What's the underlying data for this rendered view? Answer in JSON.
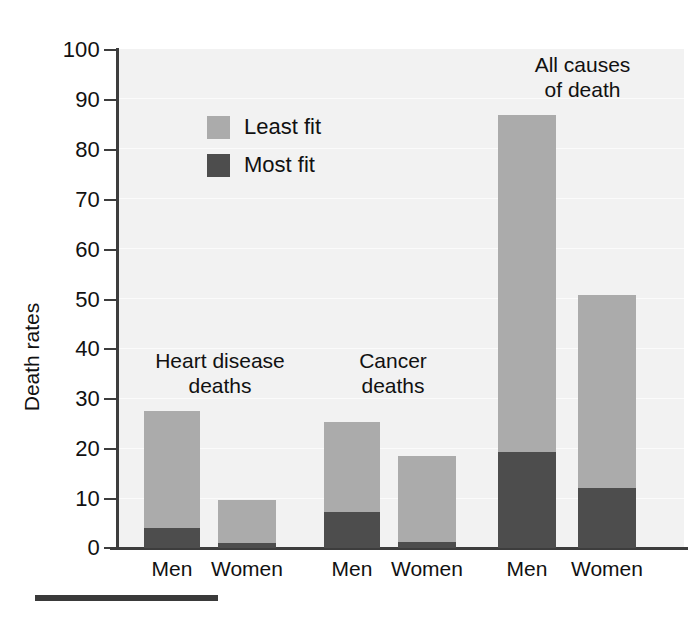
{
  "chart_data": {
    "type": "bar",
    "subtype": "stacked",
    "title": "",
    "xlabel": "",
    "ylabel": "Death rates",
    "ylim": [
      0,
      100
    ],
    "ytick_values": [
      0,
      10,
      20,
      30,
      40,
      50,
      60,
      70,
      80,
      90,
      100
    ],
    "ytick_labels": [
      "0",
      "10",
      "20",
      "30",
      "40",
      "50",
      "60",
      "70",
      "80",
      "90",
      "100"
    ],
    "grid": true,
    "legend_position": "upper-left-inside",
    "categories": [
      "Men",
      "Women",
      "Men",
      "Women",
      "Men",
      "Women"
    ],
    "groups": [
      {
        "label": "Heart disease\ndeaths",
        "label_line1": "Heart disease",
        "label_line2": "deaths",
        "bars": [
          {
            "category": "Men",
            "most_fit": 4.0,
            "least_fit": 23.5,
            "total": 27.5
          },
          {
            "category": "Women",
            "most_fit": 1.0,
            "least_fit": 8.6,
            "total": 9.6
          }
        ]
      },
      {
        "label": "Cancer\ndeaths",
        "label_line1": "Cancer",
        "label_line2": "deaths",
        "bars": [
          {
            "category": "Men",
            "most_fit": 7.2,
            "least_fit": 18.1,
            "total": 25.3
          },
          {
            "category": "Women",
            "most_fit": 1.2,
            "least_fit": 17.2,
            "total": 18.4
          }
        ]
      },
      {
        "label": "All causes\nof death",
        "label_line1": "All causes",
        "label_line2": "of death",
        "bars": [
          {
            "category": "Men",
            "most_fit": 19.2,
            "least_fit": 67.6,
            "total": 86.8
          },
          {
            "category": "Women",
            "most_fit": 12.0,
            "least_fit": 38.7,
            "total": 50.7
          }
        ]
      }
    ],
    "series": [
      {
        "name": "Least fit",
        "color": "#ababab",
        "values": [
          23.5,
          8.6,
          18.1,
          17.2,
          67.6,
          38.7
        ]
      },
      {
        "name": "Most fit",
        "color": "#4d4d4d",
        "values": [
          4.0,
          1.0,
          7.2,
          1.2,
          19.2,
          12.0
        ]
      }
    ]
  },
  "legend": {
    "items": [
      {
        "label": "Least fit",
        "color": "#ababab"
      },
      {
        "label": "Most fit",
        "color": "#4d4d4d"
      }
    ]
  },
  "colors": {
    "least_fit": "#ababab",
    "most_fit": "#4d4d4d",
    "plot_background": "#f2f2f2",
    "axis": "#3d3d3d",
    "text": "#111111",
    "footer_rule": "#3a3a3a"
  }
}
